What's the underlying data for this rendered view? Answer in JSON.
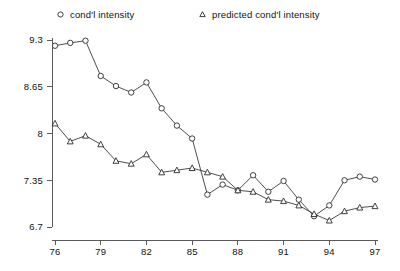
{
  "legend": {
    "observed": {
      "label": "cond'l intensity",
      "marker": "circle-marker-icon"
    },
    "predicted": {
      "label": "predicted cond'l intensity",
      "marker": "triangle-marker-icon"
    }
  },
  "axes": {
    "y_ticks": [
      "9.3",
      "8.65",
      "8",
      "7.35",
      "6.7"
    ],
    "x_ticks": [
      "76",
      "79",
      "82",
      "85",
      "88",
      "91",
      "94",
      "97"
    ]
  },
  "chart_data": {
    "type": "line",
    "title": "",
    "xlabel": "",
    "ylabel": "",
    "xlim": [
      76,
      97
    ],
    "ylim": [
      6.7,
      9.3
    ],
    "ytick_values": [
      9.3,
      8.65,
      8,
      7.35,
      6.7
    ],
    "xtick_values": [
      76,
      79,
      82,
      85,
      88,
      91,
      94,
      97
    ],
    "grid": false,
    "legend_position": "top",
    "x": [
      76,
      77,
      78,
      79,
      80,
      81,
      82,
      83,
      84,
      85,
      86,
      87,
      88,
      89,
      90,
      91,
      92,
      93,
      94,
      95,
      96,
      97
    ],
    "series": [
      {
        "name": "cond'l intensity",
        "marker": "circle",
        "values": [
          9.22,
          9.26,
          9.29,
          8.8,
          8.66,
          8.57,
          8.71,
          8.35,
          8.11,
          7.93,
          7.15,
          7.29,
          7.21,
          7.42,
          7.19,
          7.34,
          7.08,
          6.85,
          7.0,
          7.35,
          7.4,
          7.36
        ]
      },
      {
        "name": "predicted cond'l intensity",
        "marker": "triangle",
        "values": [
          8.14,
          7.89,
          7.97,
          7.85,
          7.62,
          7.58,
          7.71,
          7.46,
          7.49,
          7.52,
          7.46,
          7.4,
          7.21,
          7.19,
          7.08,
          7.06,
          7.0,
          6.88,
          6.79,
          6.92,
          6.97,
          6.99
        ]
      }
    ]
  },
  "colors": {
    "axis": "#5a5a5a",
    "line": "#3a3a3a",
    "marker_stroke": "#2b2b2b",
    "marker_fill": "#ffffff",
    "text": "#111111",
    "background": "#ffffff"
  }
}
